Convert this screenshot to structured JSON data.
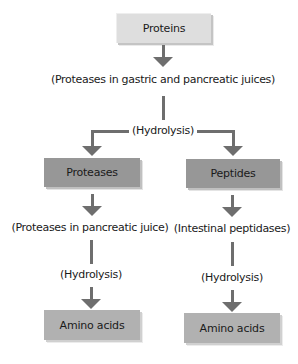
{
  "diagram": {
    "title_node": "Proteins",
    "step1": {
      "enzyme": "(Proteases in gastric and pancreatic juices)",
      "process": "(Hydrolysis)"
    },
    "branches": [
      {
        "product": "Proteases",
        "enzyme": "(Proteases in pancreatic juice)",
        "process": "(Hydrolysis)",
        "final": "Amino acids"
      },
      {
        "product": "Peptides",
        "enzyme": "(Intestinal peptidases)",
        "process": "(Hydrolysis)",
        "final": "Amino acids"
      }
    ],
    "colors": {
      "top_box": "#dedede",
      "middle_box": "#979797",
      "final_box": "#b1b1b1",
      "connector": "#6e6e6e"
    }
  }
}
